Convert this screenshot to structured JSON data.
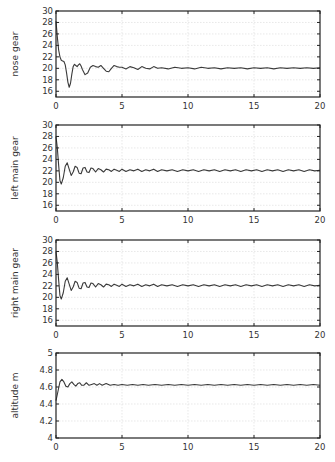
{
  "figure": {
    "background": "#ffffff",
    "line_color": "#3a3a3a",
    "grid_color": "#d9d9d9"
  },
  "chart_data": [
    {
      "type": "line",
      "title": "",
      "xlabel": "",
      "ylabel": "nose gear",
      "xlim": [
        0,
        20
      ],
      "ylim": [
        15,
        30
      ],
      "xticks": [
        0,
        5,
        10,
        15,
        20
      ],
      "yticks": [
        16,
        18,
        20,
        22,
        24,
        26,
        28,
        30
      ],
      "grid": true,
      "frame_px": {
        "left": 56,
        "right": 320,
        "top": 11,
        "bottom": 97
      },
      "series": [
        {
          "name": "nose gear",
          "x": [
            0,
            0.1,
            0.2,
            0.3,
            0.4,
            0.5,
            0.6,
            0.7,
            0.8,
            0.9,
            1.0,
            1.1,
            1.2,
            1.3,
            1.4,
            1.5,
            1.6,
            1.7,
            1.8,
            1.9,
            2.0,
            2.2,
            2.4,
            2.6,
            2.8,
            3.0,
            3.2,
            3.4,
            3.6,
            3.8,
            4.0,
            4.2,
            4.4,
            4.6,
            4.8,
            5.0,
            5.3,
            5.6,
            5.9,
            6.2,
            6.5,
            6.8,
            7.1,
            7.4,
            7.7,
            8.0,
            8.5,
            9,
            9.5,
            10,
            10.5,
            11,
            11.5,
            12,
            12.5,
            13,
            13.5,
            14,
            14.5,
            15,
            15.5,
            16,
            16.5,
            17,
            17.5,
            18,
            18.5,
            19,
            19.5,
            20
          ],
          "y": [
            28.2,
            25.5,
            23.2,
            22.0,
            21.4,
            21.3,
            21.2,
            20.6,
            19.2,
            17.6,
            16.7,
            17.4,
            19.0,
            20.3,
            20.7,
            20.5,
            20.3,
            20.6,
            20.8,
            20.4,
            19.8,
            18.9,
            19.2,
            20.2,
            20.5,
            20.3,
            20.2,
            20.5,
            20.0,
            19.5,
            19.4,
            20.0,
            20.5,
            20.3,
            20.2,
            20.2,
            19.9,
            20.3,
            20.1,
            19.8,
            20.3,
            20.0,
            19.9,
            20.3,
            20.0,
            20.1,
            19.9,
            20.2,
            20.0,
            20.1,
            19.9,
            20.2,
            20.0,
            20.1,
            19.9,
            20.1,
            20.0,
            20.1,
            19.9,
            20.1,
            20.0,
            20.1,
            19.9,
            20.1,
            20.0,
            20.1,
            20.0,
            20.1,
            20.0,
            20.1
          ]
        }
      ]
    },
    {
      "type": "line",
      "title": "",
      "xlabel": "",
      "ylabel": "left main gear",
      "xlim": [
        0,
        20
      ],
      "ylim": [
        15,
        30
      ],
      "xticks": [
        0,
        5,
        10,
        15,
        20
      ],
      "yticks": [
        16,
        18,
        20,
        22,
        24,
        26,
        28,
        30
      ],
      "grid": true,
      "frame_px": {
        "left": 56,
        "right": 320,
        "top": 125,
        "bottom": 211
      },
      "series": [
        {
          "name": "left main gear",
          "x": [
            0,
            0.1,
            0.2,
            0.3,
            0.4,
            0.55,
            0.7,
            0.85,
            1.0,
            1.15,
            1.3,
            1.45,
            1.6,
            1.75,
            1.9,
            2.05,
            2.2,
            2.35,
            2.5,
            2.65,
            2.8,
            3.0,
            3.2,
            3.4,
            3.6,
            3.8,
            4.0,
            4.2,
            4.4,
            4.6,
            4.8,
            5.0,
            5.3,
            5.6,
            5.9,
            6.2,
            6.5,
            6.8,
            7.1,
            7.4,
            7.7,
            8.0,
            8.4,
            8.8,
            9.2,
            9.6,
            10,
            10.4,
            10.8,
            11.2,
            11.6,
            12,
            12.4,
            12.8,
            13.2,
            13.6,
            14,
            14.4,
            14.8,
            15.2,
            15.6,
            16,
            16.4,
            16.8,
            17.2,
            17.6,
            18,
            18.4,
            18.8,
            19.2,
            19.6,
            20
          ],
          "y": [
            28.0,
            26.0,
            23.0,
            20.3,
            19.7,
            20.8,
            22.8,
            23.4,
            22.3,
            21.2,
            21.8,
            22.8,
            22.6,
            21.6,
            21.5,
            22.5,
            22.6,
            21.8,
            21.7,
            22.5,
            22.4,
            21.8,
            22.4,
            22.2,
            21.8,
            22.3,
            22.2,
            21.9,
            22.3,
            22.1,
            21.9,
            22.3,
            21.9,
            22.2,
            22.0,
            22.3,
            21.9,
            22.2,
            22.0,
            22.3,
            21.9,
            22.2,
            22.0,
            22.2,
            21.9,
            22.2,
            22.0,
            22.2,
            21.9,
            22.2,
            22.0,
            22.2,
            21.9,
            22.2,
            22.0,
            22.2,
            21.9,
            22.2,
            22.0,
            22.2,
            21.9,
            22.2,
            22.0,
            22.2,
            21.9,
            22.2,
            22.0,
            22.2,
            21.9,
            22.2,
            22.0,
            22.1
          ]
        }
      ]
    },
    {
      "type": "line",
      "title": "",
      "xlabel": "",
      "ylabel": "right main gear",
      "xlim": [
        0,
        20
      ],
      "ylim": [
        15,
        30
      ],
      "xticks": [
        0,
        5,
        10,
        15,
        20
      ],
      "yticks": [
        16,
        18,
        20,
        22,
        24,
        26,
        28,
        30
      ],
      "grid": true,
      "frame_px": {
        "left": 56,
        "right": 320,
        "top": 240,
        "bottom": 326
      },
      "series": [
        {
          "name": "right main gear",
          "x": [
            0,
            0.1,
            0.2,
            0.3,
            0.4,
            0.55,
            0.7,
            0.85,
            1.0,
            1.15,
            1.3,
            1.45,
            1.6,
            1.75,
            1.9,
            2.05,
            2.2,
            2.35,
            2.5,
            2.65,
            2.8,
            3.0,
            3.2,
            3.4,
            3.6,
            3.8,
            4.0,
            4.2,
            4.4,
            4.6,
            4.8,
            5.0,
            5.3,
            5.6,
            5.9,
            6.2,
            6.5,
            6.8,
            7.1,
            7.4,
            7.7,
            8.0,
            8.4,
            8.8,
            9.2,
            9.6,
            10,
            10.4,
            10.8,
            11.2,
            11.6,
            12,
            12.4,
            12.8,
            13.2,
            13.6,
            14,
            14.4,
            14.8,
            15.2,
            15.6,
            16,
            16.4,
            16.8,
            17.2,
            17.6,
            18,
            18.4,
            18.8,
            19.2,
            19.6,
            20
          ],
          "y": [
            28.0,
            26.0,
            23.0,
            20.3,
            19.7,
            20.8,
            22.8,
            23.4,
            22.3,
            21.2,
            21.8,
            22.8,
            22.6,
            21.6,
            21.5,
            22.5,
            22.6,
            21.8,
            21.7,
            22.5,
            22.4,
            21.8,
            22.4,
            22.2,
            21.8,
            22.3,
            22.2,
            21.9,
            22.3,
            22.1,
            21.9,
            22.3,
            21.9,
            22.2,
            22.0,
            22.3,
            21.9,
            22.2,
            22.0,
            22.3,
            21.9,
            22.2,
            22.0,
            22.2,
            21.9,
            22.2,
            22.0,
            22.2,
            21.9,
            22.2,
            22.0,
            22.2,
            21.9,
            22.2,
            22.0,
            22.2,
            21.9,
            22.2,
            22.0,
            22.2,
            21.9,
            22.2,
            22.0,
            22.2,
            21.9,
            22.2,
            22.0,
            22.2,
            21.9,
            22.2,
            22.0,
            22.1
          ]
        }
      ]
    },
    {
      "type": "line",
      "title": "",
      "xlabel": "",
      "ylabel": "altitude m",
      "xlim": [
        0,
        20
      ],
      "ylim": [
        4,
        5
      ],
      "xticks": [
        0,
        5,
        10,
        15,
        20
      ],
      "yticks": [
        4,
        4.2,
        4.4,
        4.6,
        4.8,
        5
      ],
      "grid": true,
      "frame_px": {
        "left": 56,
        "right": 320,
        "top": 353,
        "bottom": 438
      },
      "series": [
        {
          "name": "altitude m",
          "x": [
            0,
            0.15,
            0.3,
            0.45,
            0.6,
            0.75,
            0.9,
            1.05,
            1.2,
            1.35,
            1.5,
            1.65,
            1.8,
            1.95,
            2.1,
            2.3,
            2.5,
            2.7,
            2.9,
            3.1,
            3.3,
            3.5,
            3.8,
            4.1,
            4.4,
            4.7,
            5.0,
            5.4,
            5.8,
            6.2,
            6.6,
            7.0,
            7.5,
            8,
            8.5,
            9,
            9.5,
            10,
            10.5,
            11,
            11.5,
            12,
            12.5,
            13,
            13.5,
            14,
            14.5,
            15,
            15.5,
            16,
            16.5,
            17,
            17.5,
            18,
            18.5,
            19,
            19.5,
            20
          ],
          "y": [
            4.44,
            4.55,
            4.66,
            4.69,
            4.66,
            4.61,
            4.6,
            4.64,
            4.66,
            4.63,
            4.61,
            4.64,
            4.65,
            4.62,
            4.62,
            4.65,
            4.62,
            4.63,
            4.64,
            4.62,
            4.64,
            4.62,
            4.64,
            4.62,
            4.63,
            4.62,
            4.63,
            4.62,
            4.63,
            4.62,
            4.63,
            4.62,
            4.63,
            4.62,
            4.63,
            4.62,
            4.63,
            4.62,
            4.63,
            4.62,
            4.63,
            4.62,
            4.63,
            4.62,
            4.63,
            4.62,
            4.63,
            4.62,
            4.63,
            4.62,
            4.63,
            4.62,
            4.63,
            4.62,
            4.63,
            4.62,
            4.63,
            4.62
          ]
        }
      ]
    }
  ]
}
